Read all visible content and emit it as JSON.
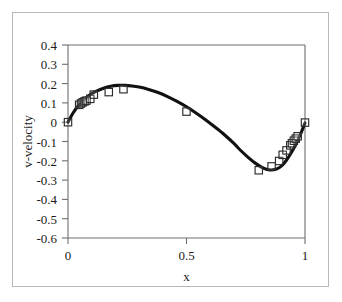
{
  "chart_data": {
    "type": "line",
    "title": "",
    "xlabel": "x",
    "ylabel": "v-velocity",
    "xlim": [
      0,
      1
    ],
    "ylim": [
      -0.6,
      0.4
    ],
    "xticks": [
      0,
      0.5,
      1
    ],
    "xtick_labels": [
      "0",
      "0.5",
      "1"
    ],
    "yticks": [
      0.4,
      0.3,
      0.2,
      0.1,
      0,
      -0.1,
      -0.2,
      -0.3,
      -0.4,
      -0.5,
      -0.6
    ],
    "ytick_labels": [
      "0.4",
      "0.3",
      "0.2",
      "0.1",
      "0",
      "-0.1",
      "-0.2",
      "-0.3",
      "-0.4",
      "-0.5",
      "-0.6"
    ],
    "grid": false,
    "legend": null,
    "series": [
      {
        "name": "curve",
        "kind": "line",
        "style": "solid-thick-black",
        "x": [
          0.0,
          0.02,
          0.04,
          0.06,
          0.08,
          0.1,
          0.12,
          0.15,
          0.18,
          0.21,
          0.24,
          0.27,
          0.3,
          0.34,
          0.38,
          0.42,
          0.46,
          0.5,
          0.54,
          0.58,
          0.62,
          0.66,
          0.7,
          0.73,
          0.76,
          0.79,
          0.82,
          0.85,
          0.88,
          0.9,
          0.92,
          0.94,
          0.96,
          0.98,
          1.0
        ],
        "y": [
          0.0,
          0.045,
          0.08,
          0.107,
          0.13,
          0.148,
          0.161,
          0.176,
          0.186,
          0.191,
          0.191,
          0.188,
          0.182,
          0.17,
          0.154,
          0.133,
          0.108,
          0.08,
          0.048,
          0.013,
          -0.025,
          -0.065,
          -0.11,
          -0.148,
          -0.182,
          -0.212,
          -0.235,
          -0.247,
          -0.243,
          -0.228,
          -0.2,
          -0.162,
          -0.118,
          -0.065,
          -0.004
        ]
      },
      {
        "name": "data-points",
        "kind": "scatter",
        "marker": "open-square",
        "x": [
          0.0,
          0.047,
          0.055,
          0.062,
          0.07,
          0.078,
          0.094,
          0.109,
          0.172,
          0.234,
          0.5,
          0.805,
          0.859,
          0.891,
          0.906,
          0.922,
          0.938,
          0.945,
          0.953,
          0.961,
          0.969,
          1.0
        ],
        "y": [
          0.0,
          0.09,
          0.097,
          0.103,
          0.108,
          0.112,
          0.121,
          0.143,
          0.156,
          0.171,
          0.055,
          -0.249,
          -0.229,
          -0.201,
          -0.169,
          -0.146,
          -0.12,
          -0.109,
          -0.096,
          -0.085,
          -0.073,
          -0.002
        ]
      }
    ]
  },
  "axes": {
    "x_axis_label": "x",
    "y_axis_label": "v-velocity"
  }
}
